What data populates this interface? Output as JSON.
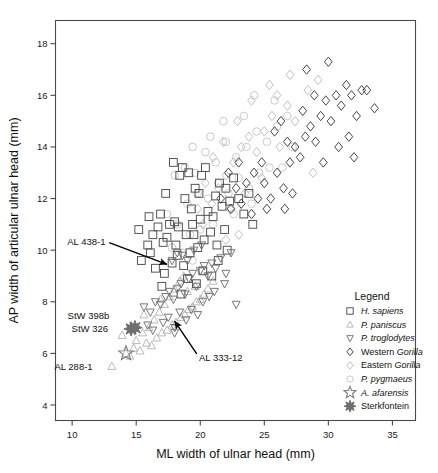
{
  "chart_data": {
    "type": "scatter",
    "title": "",
    "xlabel": "ML width of ulnar head (mm)",
    "ylabel": "AP width of articular ulnar head (mm)",
    "xlim": [
      8.7,
      36.8
    ],
    "ylim": [
      3.4,
      18.9
    ],
    "xticks": [
      10,
      15,
      20,
      25,
      30,
      35
    ],
    "yticks": [
      4,
      6,
      8,
      10,
      12,
      14,
      16,
      18
    ],
    "grid": false,
    "legend_position": "lower-right-inside",
    "legend_title": "Legend",
    "series": [
      {
        "name": "H. sapiens",
        "marker": "square",
        "color": "#4d4d4d",
        "points": [
          [
            15.4,
            9.6
          ],
          [
            16.9,
            11.4
          ],
          [
            17.6,
            11.0
          ],
          [
            18.0,
            11.1
          ],
          [
            18.3,
            10.9
          ],
          [
            16.3,
            10.6
          ],
          [
            17.1,
            10.3
          ],
          [
            18.9,
            10.6
          ],
          [
            19.3,
            11.6
          ],
          [
            19.6,
            12.4
          ],
          [
            19.9,
            12.2
          ],
          [
            20.1,
            12.9
          ],
          [
            20.4,
            13.2
          ],
          [
            19.1,
            13.0
          ],
          [
            18.6,
            13.2
          ],
          [
            18.4,
            12.9
          ],
          [
            17.9,
            13.4
          ],
          [
            21.2,
            12.1
          ],
          [
            21.5,
            12.6
          ],
          [
            22.0,
            12.4
          ],
          [
            22.3,
            11.9
          ],
          [
            16.1,
            9.9
          ],
          [
            16.5,
            9.3
          ],
          [
            17.2,
            9.1
          ],
          [
            17.8,
            9.5
          ],
          [
            18.2,
            9.8
          ],
          [
            18.7,
            9.4
          ],
          [
            19.2,
            9.9
          ],
          [
            19.8,
            10.1
          ],
          [
            20.3,
            10.4
          ],
          [
            20.8,
            10.7
          ],
          [
            21.3,
            10.2
          ],
          [
            21.9,
            10.8
          ],
          [
            15.9,
            10.2
          ],
          [
            16.7,
            10.9
          ],
          [
            17.4,
            10.5
          ],
          [
            18.1,
            10.2
          ],
          [
            19.5,
            10.6
          ],
          [
            20.0,
            11.2
          ],
          [
            20.6,
            11.5
          ],
          [
            21.0,
            11.3
          ],
          [
            21.7,
            11.7
          ],
          [
            22.6,
            12.8
          ],
          [
            23.0,
            12.0
          ],
          [
            17.3,
            12.2
          ],
          [
            18.8,
            12.0
          ],
          [
            19.4,
            11.0
          ],
          [
            15.2,
            10.8
          ],
          [
            16.0,
            11.3
          ],
          [
            19.0,
            8.9
          ],
          [
            20.2,
            9.2
          ],
          [
            17.0,
            8.6
          ],
          [
            18.5,
            8.3
          ],
          [
            19.7,
            8.7
          ],
          [
            20.9,
            9.0
          ],
          [
            21.4,
            9.6
          ],
          [
            22.1,
            10.0
          ],
          [
            23.4,
            11.4
          ],
          [
            23.8,
            12.2
          ],
          [
            24.1,
            11.0
          ]
        ]
      },
      {
        "name": "P. paniscus",
        "marker": "triangle-up",
        "color": "#b4b4b4",
        "points": [
          [
            13.1,
            5.5
          ],
          [
            14.2,
            6.0
          ],
          [
            14.8,
            6.2
          ],
          [
            15.3,
            6.1
          ],
          [
            15.8,
            6.4
          ],
          [
            16.2,
            6.3
          ],
          [
            16.6,
            6.6
          ],
          [
            17.0,
            6.8
          ],
          [
            17.4,
            6.9
          ],
          [
            17.8,
            7.1
          ],
          [
            18.1,
            7.2
          ],
          [
            18.5,
            7.4
          ],
          [
            18.8,
            7.5
          ],
          [
            19.1,
            7.7
          ],
          [
            19.4,
            7.8
          ],
          [
            19.7,
            8.0
          ],
          [
            20.0,
            8.1
          ],
          [
            20.3,
            8.3
          ],
          [
            16.0,
            7.0
          ],
          [
            16.4,
            7.3
          ],
          [
            16.8,
            7.6
          ],
          [
            17.2,
            7.9
          ],
          [
            17.6,
            8.2
          ],
          [
            18.0,
            8.5
          ],
          [
            18.4,
            8.8
          ],
          [
            18.7,
            9.0
          ],
          [
            15.5,
            6.8
          ],
          [
            15.0,
            6.5
          ],
          [
            19.0,
            8.4
          ],
          [
            19.6,
            8.6
          ],
          [
            20.6,
            8.5
          ],
          [
            21.0,
            8.8
          ],
          [
            14.5,
            5.9
          ],
          [
            13.9,
            6.7
          ],
          [
            15.6,
            7.5
          ],
          [
            16.9,
            8.1
          ]
        ]
      },
      {
        "name": "P. troglodytes",
        "marker": "triangle-down",
        "color": "#707070",
        "points": [
          [
            15.6,
            7.8
          ],
          [
            16.1,
            7.6
          ],
          [
            16.5,
            8.0
          ],
          [
            16.9,
            7.9
          ],
          [
            17.3,
            8.2
          ],
          [
            17.6,
            8.4
          ],
          [
            17.9,
            8.1
          ],
          [
            18.2,
            8.5
          ],
          [
            18.5,
            8.7
          ],
          [
            18.8,
            8.3
          ],
          [
            19.1,
            8.9
          ],
          [
            19.4,
            9.1
          ],
          [
            19.7,
            8.6
          ],
          [
            20.0,
            9.2
          ],
          [
            20.3,
            9.4
          ],
          [
            20.6,
            9.0
          ],
          [
            20.9,
            9.5
          ],
          [
            21.2,
            9.3
          ],
          [
            21.6,
            9.7
          ],
          [
            22.0,
            9.1
          ],
          [
            17.1,
            7.2
          ],
          [
            17.5,
            7.4
          ],
          [
            18.0,
            7.0
          ],
          [
            18.4,
            7.6
          ],
          [
            18.9,
            7.3
          ],
          [
            19.3,
            7.7
          ],
          [
            19.8,
            7.5
          ],
          [
            20.2,
            8.0
          ],
          [
            20.7,
            8.2
          ],
          [
            21.1,
            8.4
          ],
          [
            16.3,
            6.9
          ],
          [
            15.9,
            7.1
          ],
          [
            22.4,
            9.9
          ],
          [
            22.8,
            7.9
          ],
          [
            21.9,
            8.7
          ],
          [
            19.0,
            9.6
          ],
          [
            18.6,
            9.8
          ],
          [
            18.2,
            9.9
          ],
          [
            17.8,
            9.6
          ],
          [
            19.5,
            10.0
          ],
          [
            20.1,
            10.2
          ],
          [
            18.0,
            6.8
          ]
        ]
      },
      {
        "name": "Western Gorilla",
        "marker": "diamond",
        "color": "#3c3c3c",
        "points": [
          [
            25.0,
            12.6
          ],
          [
            25.5,
            12.0
          ],
          [
            26.0,
            13.0
          ],
          [
            26.5,
            12.4
          ],
          [
            27.0,
            13.4
          ],
          [
            27.4,
            14.0
          ],
          [
            27.8,
            13.6
          ],
          [
            28.2,
            14.4
          ],
          [
            28.6,
            14.8
          ],
          [
            29.0,
            14.2
          ],
          [
            29.4,
            15.2
          ],
          [
            29.8,
            15.8
          ],
          [
            30.2,
            15.0
          ],
          [
            30.6,
            16.0
          ],
          [
            31.0,
            15.6
          ],
          [
            31.4,
            16.4
          ],
          [
            31.8,
            16.0
          ],
          [
            32.2,
            15.2
          ],
          [
            32.6,
            16.2
          ],
          [
            28.0,
            15.4
          ],
          [
            28.9,
            16.0
          ],
          [
            26.8,
            14.2
          ],
          [
            24.5,
            12.0
          ],
          [
            24.0,
            11.4
          ],
          [
            23.6,
            12.6
          ],
          [
            23.2,
            11.8
          ],
          [
            30.0,
            17.3
          ],
          [
            28.3,
            17.0
          ],
          [
            33.0,
            16.2
          ],
          [
            33.6,
            15.5
          ],
          [
            25.8,
            14.6
          ],
          [
            26.3,
            15.0
          ],
          [
            24.8,
            13.4
          ],
          [
            27.2,
            12.2
          ],
          [
            29.6,
            13.4
          ],
          [
            30.8,
            14.0
          ],
          [
            31.6,
            14.4
          ],
          [
            32.0,
            13.6
          ],
          [
            22.8,
            12.4
          ],
          [
            23.0,
            13.4
          ],
          [
            22.4,
            11.6
          ],
          [
            24.2,
            13.0
          ],
          [
            21.6,
            12.0
          ],
          [
            22.2,
            13.0
          ],
          [
            25.2,
            11.6
          ],
          [
            26.6,
            11.6
          ]
        ]
      },
      {
        "name": "Eastern Gorilla",
        "marker": "diamond-light",
        "color": "#bdbdbd",
        "points": [
          [
            22.0,
            12.9
          ],
          [
            22.6,
            13.4
          ],
          [
            23.2,
            14.0
          ],
          [
            23.8,
            14.4
          ],
          [
            24.4,
            13.8
          ],
          [
            25.0,
            14.6
          ],
          [
            25.6,
            15.2
          ],
          [
            26.2,
            14.0
          ],
          [
            26.8,
            15.6
          ],
          [
            27.4,
            15.0
          ],
          [
            24.0,
            15.8
          ],
          [
            25.4,
            16.4
          ],
          [
            26.0,
            16.0
          ],
          [
            21.4,
            12.4
          ],
          [
            20.9,
            11.8
          ],
          [
            22.3,
            11.6
          ],
          [
            23.5,
            12.2
          ],
          [
            24.8,
            12.8
          ],
          [
            27.0,
            16.8
          ],
          [
            28.4,
            16.2
          ],
          [
            29.2,
            16.6
          ],
          [
            20.4,
            12.6
          ],
          [
            21.0,
            13.6
          ],
          [
            21.8,
            14.2
          ],
          [
            22.9,
            15.0
          ],
          [
            19.8,
            11.6
          ],
          [
            20.2,
            11.0
          ],
          [
            28.8,
            13.0
          ],
          [
            23.0,
            10.6
          ],
          [
            22.0,
            10.4
          ]
        ]
      },
      {
        "name": "P. pygmaeus",
        "marker": "circle",
        "color": "#c6c6c6",
        "points": [
          [
            18.0,
            12.9
          ],
          [
            18.8,
            13.2
          ],
          [
            19.6,
            13.0
          ],
          [
            20.4,
            13.8
          ],
          [
            21.2,
            13.4
          ],
          [
            22.0,
            14.2
          ],
          [
            22.8,
            13.6
          ],
          [
            23.6,
            14.0
          ],
          [
            24.4,
            14.6
          ],
          [
            25.2,
            14.2
          ],
          [
            26.0,
            14.8
          ],
          [
            19.0,
            11.8
          ],
          [
            19.8,
            12.2
          ],
          [
            20.6,
            12.0
          ],
          [
            21.4,
            12.6
          ],
          [
            22.2,
            12.2
          ],
          [
            23.0,
            12.8
          ],
          [
            23.8,
            12.4
          ],
          [
            24.6,
            13.0
          ],
          [
            25.4,
            13.2
          ],
          [
            17.4,
            11.4
          ],
          [
            18.2,
            11.0
          ],
          [
            19.2,
            10.6
          ],
          [
            20.0,
            10.8
          ],
          [
            21.0,
            11.0
          ],
          [
            22.6,
            11.4
          ],
          [
            24.0,
            11.8
          ],
          [
            26.8,
            15.2
          ],
          [
            25.8,
            15.8
          ],
          [
            24.2,
            16.0
          ],
          [
            20.8,
            14.4
          ],
          [
            19.4,
            14.0
          ],
          [
            18.6,
            9.9
          ],
          [
            19.4,
            9.6
          ],
          [
            20.2,
            9.2
          ],
          [
            17.8,
            10.1
          ],
          [
            26.4,
            13.2
          ],
          [
            27.2,
            14.0
          ],
          [
            23.4,
            15.2
          ],
          [
            21.8,
            15.0
          ]
        ]
      },
      {
        "name": "A. afarensis",
        "marker": "star5",
        "color": "#808080",
        "points": [
          [
            14.2,
            6.0
          ]
        ]
      },
      {
        "name": "Sterkfontein",
        "marker": "starburst",
        "color": "#6e6e6e",
        "points": [
          [
            14.6,
            6.95
          ],
          [
            14.9,
            7.0
          ]
        ]
      }
    ],
    "annotations": [
      {
        "label": "AL 438-1",
        "text_x": 12.6,
        "text_y": 10.35,
        "tip_x": 17.4,
        "tip_y": 9.45
      },
      {
        "label": "StW 398b",
        "text_x": 12.9,
        "text_y": 7.45,
        "tip_x": null,
        "tip_y": null
      },
      {
        "label": "StW 326",
        "text_x": 12.8,
        "text_y": 6.95,
        "tip_x": null,
        "tip_y": null
      },
      {
        "label": "AL 288-1",
        "text_x": 11.6,
        "text_y": 5.5,
        "tip_x": null,
        "tip_y": null
      },
      {
        "label": "AL 333-12",
        "text_x": 19.9,
        "text_y": 5.85,
        "tip_x": 18.0,
        "tip_y": 7.25
      }
    ]
  },
  "legend": {
    "title": "Legend",
    "items": [
      {
        "label": "H. sapiens",
        "italic_part": "H. sapiens",
        "marker": "square"
      },
      {
        "label": "P. paniscus",
        "italic_part": "P. paniscus",
        "marker": "triangle-up"
      },
      {
        "label": "P. troglodytes",
        "italic_part": "P. troglodytes",
        "marker": "triangle-down"
      },
      {
        "label": "Western Gorilla",
        "italic_part": "Gorilla",
        "marker": "diamond"
      },
      {
        "label": "Eastern Gorilla",
        "italic_part": "Gorilla",
        "marker": "diamond-light"
      },
      {
        "label": "P. pygmaeus",
        "italic_part": "P. pygmaeus",
        "marker": "circle"
      },
      {
        "label": "A. afarensis",
        "italic_part": "A. afarensis",
        "marker": "star5"
      },
      {
        "label": "Sterkfontein",
        "italic_part": "",
        "marker": "starburst"
      }
    ]
  },
  "axes": {
    "x_title": "ML width of ulnar head (mm)",
    "y_title": "AP width of articular ulnar head (mm)",
    "x_tick_labels": [
      "10",
      "15",
      "20",
      "25",
      "30",
      "35"
    ],
    "y_tick_labels": [
      "4",
      "6",
      "8",
      "10",
      "12",
      "14",
      "16",
      "18"
    ]
  },
  "colors": {
    "axis": "#4a4a4a",
    "text": "#1a1a1a",
    "arrow": "#000000"
  }
}
